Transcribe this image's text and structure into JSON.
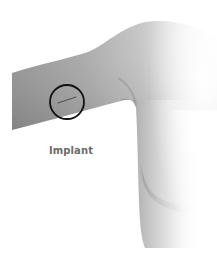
{
  "figure": {
    "highlight": "implant-site-circle",
    "label": "Implant",
    "colors": {
      "skin_dark": "#8e8e8e",
      "skin_mid": "#b5b5b5",
      "skin_light": "#f2f2f2",
      "circle_stroke": "#111111",
      "implant_rod": "#555555",
      "label_text": "#6b6b6b"
    }
  }
}
